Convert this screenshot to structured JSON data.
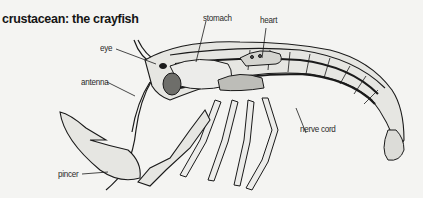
{
  "title": "crustacean: the crayfish",
  "labels": {
    "stomach": "stomach",
    "heart": "heart",
    "eye": "eye",
    "antenna": "antenna",
    "nerve_cord": "nerve cord",
    "pincer": "pincer"
  },
  "colors": {
    "background": "#f4f4f2",
    "ink": "#1a1a1a",
    "shell_fill": "#e6e6e2",
    "organ_fill": "#bdbdb8",
    "eye_fill": "#6e6e6a"
  }
}
